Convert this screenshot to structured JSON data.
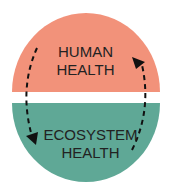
{
  "diagram": {
    "top": {
      "line1": "HUMAN",
      "line2": "HEALTH",
      "color": "#F2927A"
    },
    "bottom": {
      "line1": "ECOSYSTEM",
      "line2": "HEALTH",
      "color": "#5FA896"
    }
  }
}
